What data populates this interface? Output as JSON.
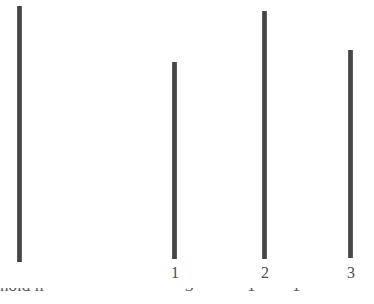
{
  "figure": {
    "background_color": "#ffffff",
    "bar_color": "#4a4a4a",
    "label_color": "#4d4d4d",
    "width": 374,
    "height": 304
  },
  "chart_data": {
    "type": "bar",
    "title": "",
    "subtitle": "",
    "xlabel": "",
    "ylabel": "",
    "grid": false,
    "legend": null,
    "orientation": "vertical",
    "note": "Four thin vertical bars on a white scanned page; only the last three carry tick labels 1, 2 and 3. Heights are read in pixels from the common baseline at the bottom of the bars.",
    "categories": [
      "",
      "1",
      "2",
      "3"
    ],
    "tick_labels": [
      "1",
      "2",
      "3"
    ],
    "values": [
      256,
      197,
      248,
      208
    ],
    "ylim": [
      0,
      270
    ],
    "bars": [
      {
        "label": "",
        "has_tick_label": false,
        "value": 256,
        "left_px": 17,
        "top_px": 6,
        "bottom_px": 262,
        "width_px": 5
      },
      {
        "label": "1",
        "has_tick_label": true,
        "value": 197,
        "left_px": 172,
        "top_px": 62,
        "bottom_px": 259,
        "width_px": 5
      },
      {
        "label": "2",
        "has_tick_label": true,
        "value": 248,
        "left_px": 262,
        "top_px": 11,
        "bottom_px": 259,
        "width_px": 5
      },
      {
        "label": "3",
        "has_tick_label": true,
        "value": 208,
        "left_px": 348,
        "top_px": 50,
        "bottom_px": 258,
        "width_px": 5
      }
    ]
  },
  "tick_row": {
    "items": [
      {
        "text": "1",
        "center_x": 175,
        "top_px": 265
      },
      {
        "text": "2",
        "center_x": 265,
        "top_px": 265
      },
      {
        "text": "3",
        "center_x": 351,
        "top_px": 265
      }
    ]
  },
  "bottom_caption": {
    "visible": "partially cut off at the page edge - only the tops of the letters are rendered",
    "top_px": 288,
    "segments": [
      {
        "text": "hold li",
        "left_px": 0
      },
      {
        "text": "3",
        "left_px": 185
      },
      {
        "text": "1",
        "left_px": 247
      },
      {
        "text": "1",
        "left_px": 292
      }
    ]
  }
}
